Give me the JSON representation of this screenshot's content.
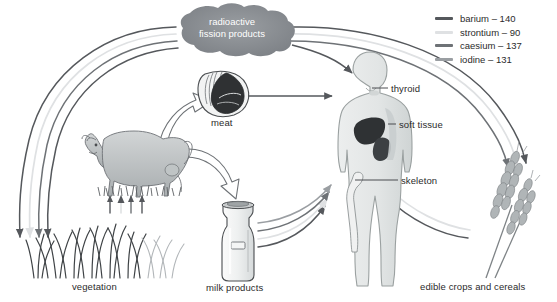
{
  "diagram": {
    "title_node": {
      "name": "radioactive-fission-products",
      "line1": "radioactive",
      "line2": "fission products"
    },
    "nodes": [
      {
        "id": "meat",
        "label": "meat"
      },
      {
        "id": "vegetation",
        "label": "vegetation"
      },
      {
        "id": "milk",
        "label": "milk products"
      },
      {
        "id": "crops",
        "label": "edible crops and cereals"
      }
    ],
    "body_labels": [
      {
        "id": "thyroid",
        "label": "thyroid"
      },
      {
        "id": "soft-tissue",
        "label": "soft tissue"
      },
      {
        "id": "skeleton",
        "label": "skeleton"
      }
    ]
  },
  "legend": {
    "items": [
      {
        "label": "barium – 140",
        "color": "#55585c"
      },
      {
        "label": "strontium – 90",
        "color": "#dfe1e3"
      },
      {
        "label": "caesium – 137",
        "color": "#6e7276"
      },
      {
        "label": "iodine – 131",
        "color": "#9a9ea2"
      }
    ]
  },
  "colors": {
    "arrow_dark": "#55585c",
    "arrow_light": "#dfe1e3",
    "arrow_mid": "#6e7276",
    "arrow_gray": "#9a9ea2",
    "cloud": "#8c9094",
    "body_fill": "#e3e6e6",
    "body_stroke": "#9aa0a0",
    "organ_dark": "#3a3d40",
    "text": "#2b2b2b",
    "background": "#ffffff"
  }
}
